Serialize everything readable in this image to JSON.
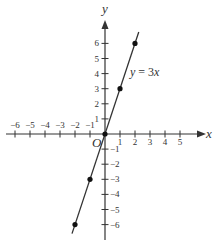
{
  "chart_data": {
    "type": "line",
    "title": "",
    "xlabel": "x",
    "ylabel": "y",
    "origin_label": "O",
    "xlim": [
      -6,
      5
    ],
    "ylim": [
      -6,
      6
    ],
    "x_ticks": [
      -6,
      -5,
      -4,
      -3,
      -2,
      -1,
      1,
      2,
      3,
      4,
      5
    ],
    "x_tick_labels": [
      "−6",
      "−5",
      "−4",
      "−3",
      "−2",
      "−1",
      "1",
      "2",
      "3",
      "4",
      "5"
    ],
    "y_ticks": [
      6,
      5,
      4,
      3,
      2,
      1,
      -1,
      -2,
      -3,
      -4,
      -5,
      -6
    ],
    "y_tick_labels": [
      "6",
      "5",
      "4",
      "3",
      "2",
      "1",
      "−1",
      "−2",
      "−3",
      "−4",
      "−5",
      "−6"
    ],
    "grid": false,
    "series": [
      {
        "name": "y = 3x",
        "equation": "y = 3x",
        "x": [
          -2,
          -1,
          0,
          1,
          2
        ],
        "y": [
          -6,
          -3,
          0,
          3,
          6
        ],
        "marked_points": [
          [
            -2,
            -6
          ],
          [
            -1,
            -3
          ],
          [
            0,
            0
          ],
          [
            1,
            3
          ],
          [
            2,
            6
          ]
        ]
      }
    ],
    "annotations": [
      {
        "text": "y = 3x",
        "at": [
          2.2,
          4
        ]
      }
    ],
    "colors": {
      "line": "#333333",
      "axis": "#333333",
      "points": "#111111"
    }
  }
}
